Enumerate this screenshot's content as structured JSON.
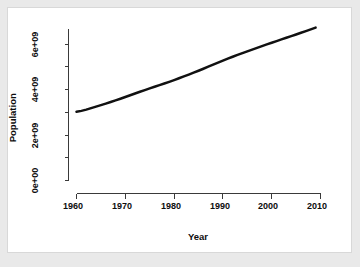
{
  "figure": {
    "background_color": "#e9e9e9",
    "canvas_color": "#ffffff",
    "border_color": "#d8d8d8",
    "axis_color": "#3a3a3a",
    "line_color": "#111111"
  },
  "chart_data": {
    "type": "line",
    "title": "",
    "subtitle": "",
    "xlabel": "Year",
    "ylabel": "Population",
    "xlim": [
      1958,
      2011
    ],
    "ylim": [
      0,
      7000000000
    ],
    "grid": false,
    "legend": null,
    "annotations": [],
    "xticks": [
      1960,
      1970,
      1980,
      1990,
      2000,
      2010
    ],
    "xtick_labels": [
      "1960",
      "1970",
      "1980",
      "1990",
      "2000",
      "2010"
    ],
    "yticks": [
      0,
      1000000000,
      2000000000,
      3000000000,
      4000000000,
      5000000000,
      6000000000
    ],
    "ytick_labeled": [
      0,
      2000000000,
      4000000000,
      6000000000
    ],
    "ytick_labels": [
      "0e+00",
      "2e+09",
      "4e+09",
      "6e+09"
    ],
    "series": [
      {
        "name": "World Population",
        "line_width": 2.5,
        "x": [
          1960,
          1961,
          1962,
          1963,
          1964,
          1965,
          1966,
          1967,
          1968,
          1969,
          1970,
          1971,
          1972,
          1973,
          1974,
          1975,
          1976,
          1977,
          1978,
          1979,
          1980,
          1981,
          1982,
          1983,
          1984,
          1985,
          1986,
          1987,
          1988,
          1989,
          1990,
          1991,
          1992,
          1993,
          1994,
          1995,
          1996,
          1997,
          1998,
          1999,
          2000,
          2001,
          2002,
          2003,
          2004,
          2005,
          2006,
          2007,
          2008,
          2009
        ],
        "values": [
          3032160000,
          3072510000,
          3126210000,
          3192910000,
          3257640000,
          3323180000,
          3392740000,
          3462110000,
          3532750000,
          3608420000,
          3684830000,
          3762150000,
          3838910000,
          3914290000,
          3989390000,
          4063100000,
          4135240000,
          4206480000,
          4278680000,
          4353180000,
          4430020000,
          4509250000,
          4591010000,
          4674200000,
          4757560000,
          4842460000,
          4930290000,
          5019540000,
          5109900000,
          5199000000,
          5287270000,
          5373760000,
          5458170000,
          5540070000,
          5620140000,
          5698810000,
          5776410000,
          5852890000,
          5928450000,
          6003200000,
          6077360000,
          6151070000,
          6224130000,
          6296860000,
          6369840000,
          6443310000,
          6517510000,
          6592450000,
          6668090000,
          6744160000
        ]
      }
    ]
  },
  "axes": {
    "x_title": "Year",
    "y_title": "Population",
    "x_tick_labels": [
      "1960",
      "1970",
      "1980",
      "1990",
      "2000",
      "2010"
    ],
    "y_tick_labels": [
      "0e+00",
      "2e+09",
      "4e+09",
      "6e+09"
    ]
  }
}
